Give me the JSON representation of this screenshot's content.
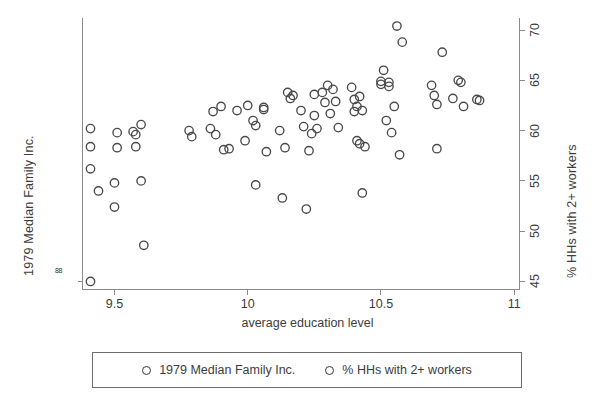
{
  "chart_data": {
    "type": "scatter",
    "title": "",
    "xlabel": "average education level",
    "ylabel_left": "1979 Median Family Inc.",
    "ylabel_right": "% HHs with 2+ workers",
    "xlim": [
      9.38,
      11.02
    ],
    "xticks": [
      "9.5",
      "10",
      "10.5",
      "11"
    ],
    "xtick_values": [
      9.5,
      10,
      10.5,
      11
    ],
    "ylim_right": [
      44.2,
      71.2
    ],
    "yticks_right": [
      "45",
      "50",
      "55",
      "60",
      "65",
      "70"
    ],
    "ytick_values_right": [
      45,
      50,
      55,
      60,
      65,
      70
    ],
    "ytick_left_label": "88",
    "grid": false,
    "legend_position": "below-plot",
    "marker": "open-circle",
    "marker_color": "#494949",
    "series": [
      {
        "name": "1979 Median Family Inc.",
        "marker": "open-circle",
        "points": [
          [
            9.41,
            45.0
          ],
          [
            9.41,
            60.2
          ],
          [
            9.41,
            58.4
          ],
          [
            9.41,
            56.2
          ],
          [
            9.44,
            54.0
          ],
          [
            9.5,
            54.8
          ],
          [
            9.5,
            52.4
          ],
          [
            9.51,
            59.8
          ],
          [
            9.51,
            58.3
          ],
          [
            9.57,
            59.9
          ],
          [
            9.58,
            58.4
          ],
          [
            9.58,
            59.6
          ],
          [
            9.6,
            60.6
          ],
          [
            9.6,
            55.0
          ],
          [
            9.61,
            48.6
          ],
          [
            9.78,
            60.0
          ],
          [
            9.79,
            59.4
          ],
          [
            9.86,
            60.2
          ],
          [
            9.87,
            61.9
          ],
          [
            9.88,
            59.6
          ],
          [
            9.9,
            62.4
          ],
          [
            9.91,
            58.1
          ],
          [
            9.93,
            58.2
          ],
          [
            9.96,
            62.0
          ],
          [
            9.99,
            59.0
          ],
          [
            10.0,
            62.5
          ],
          [
            10.02,
            61.0
          ],
          [
            10.03,
            60.5
          ],
          [
            10.03,
            54.6
          ],
          [
            10.06,
            62.3
          ],
          [
            10.06,
            62.1
          ],
          [
            10.07,
            57.9
          ],
          [
            10.12,
            60.0
          ],
          [
            10.13,
            53.3
          ],
          [
            10.14,
            58.3
          ],
          [
            10.15,
            63.8
          ],
          [
            10.16,
            63.2
          ],
          [
            10.17,
            63.5
          ],
          [
            10.2,
            62.0
          ],
          [
            10.21,
            60.4
          ],
          [
            10.22,
            52.2
          ],
          [
            10.23,
            58.0
          ],
          [
            10.24,
            59.7
          ],
          [
            10.25,
            61.5
          ],
          [
            10.25,
            63.6
          ],
          [
            10.26,
            60.2
          ],
          [
            10.28,
            63.8
          ],
          [
            10.29,
            62.8
          ],
          [
            10.3,
            64.5
          ],
          [
            10.31,
            61.7
          ],
          [
            10.32,
            64.1
          ],
          [
            10.33,
            62.9
          ],
          [
            10.34,
            60.3
          ],
          [
            10.39,
            64.3
          ],
          [
            10.4,
            63.1
          ],
          [
            10.4,
            61.9
          ],
          [
            10.41,
            62.4
          ],
          [
            10.41,
            59.0
          ],
          [
            10.42,
            63.4
          ],
          [
            10.42,
            58.7
          ],
          [
            10.43,
            62.0
          ],
          [
            10.43,
            53.8
          ],
          [
            10.44,
            58.4
          ],
          [
            10.5,
            64.6
          ],
          [
            10.5,
            64.9
          ],
          [
            10.51,
            66.0
          ],
          [
            10.52,
            61.0
          ],
          [
            10.53,
            64.8
          ],
          [
            10.53,
            64.4
          ],
          [
            10.54,
            59.8
          ],
          [
            10.55,
            62.4
          ],
          [
            10.56,
            70.4
          ],
          [
            10.57,
            57.6
          ],
          [
            10.58,
            68.8
          ],
          [
            10.69,
            64.5
          ],
          [
            10.7,
            63.5
          ],
          [
            10.71,
            62.6
          ],
          [
            10.71,
            58.2
          ],
          [
            10.73,
            67.8
          ],
          [
            10.77,
            63.2
          ],
          [
            10.79,
            65.0
          ],
          [
            10.8,
            64.8
          ],
          [
            10.81,
            62.4
          ],
          [
            10.86,
            63.1
          ],
          [
            10.87,
            63.0
          ]
        ]
      },
      {
        "name": "% HHs with 2+ workers",
        "marker": "open-circle",
        "points": []
      }
    ]
  },
  "axes": {
    "x_title": "average education level",
    "y_left_title": "1979 Median Family Inc.",
    "y_right_title": "% HHs with 2+ workers",
    "x_tick_labels": [
      "9.5",
      "10",
      "10.5",
      "11"
    ],
    "y_right_tick_labels": [
      "45",
      "50",
      "55",
      "60",
      "65",
      "70"
    ],
    "y_left_tick_label": "88"
  },
  "legend": {
    "entries": [
      {
        "label": "1979 Median Family Inc.",
        "marker": "open-circle"
      },
      {
        "label": "% HHs with 2+ workers",
        "marker": "open-circle"
      }
    ]
  },
  "colors": {
    "marker_stroke": "#494949",
    "axis": "#8a8a8a",
    "text": "#3d3d3d",
    "legend_border": "#6d6d6d",
    "background": "#ffffff"
  }
}
